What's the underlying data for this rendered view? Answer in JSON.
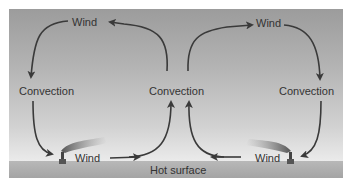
{
  "diagram": {
    "colors": {
      "sky_top": "#9c9c9c",
      "sky_bottom": "#f2f2f2",
      "ground": "#a8a8a8",
      "arrow": "#3a3a3a",
      "text": "#333333"
    },
    "labels": {
      "wind_top_left": "Wind",
      "wind_top_right": "Wind",
      "convection_left": "Convection",
      "convection_center": "Convection",
      "convection_right": "Convection",
      "wind_bottom_left": "Wind",
      "wind_bottom_right": "Wind",
      "surface": "Hot surface"
    },
    "icons": {
      "chimney_left": "smokestack-icon",
      "chimney_right": "smokestack-icon"
    }
  }
}
